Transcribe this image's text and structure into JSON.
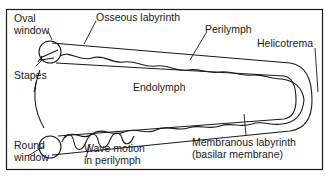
{
  "diagram": {
    "colors": {
      "line": "#1a1a1a",
      "background": "#ffffff"
    },
    "labels": {
      "oval_window": [
        "Oval",
        "window"
      ],
      "osseous_labyrinth": "Osseous labyrinth",
      "perilymph": "Perilymph",
      "helicotrema": "Helicotrema",
      "stapes": "Stapes",
      "endolymph": "Endolymph",
      "round_window": [
        "Round",
        "window"
      ],
      "wave_motion": [
        "Wave motion",
        "in perilymph"
      ],
      "membranous_labyrinth": [
        "Membranous labyrinth",
        "(basilar membrane)"
      ]
    }
  }
}
